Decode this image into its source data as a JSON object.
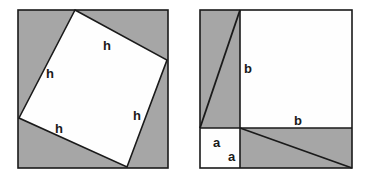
{
  "figure": {
    "width": 370,
    "height": 179,
    "background_color": "#ffffff",
    "shaded_color": "#a6a6a6",
    "unshaded_color": "#fefefe",
    "stroke_color": "#1a1a1a"
  },
  "watermark": {
    "left_text": "RAS'",
    "right_text": "PYTH",
    "sub_text": "M",
    "color": "#d9c6c6"
  },
  "left_panel": {
    "name": "tilted-square-panel",
    "outer_square": {
      "x": 18,
      "y": 10,
      "size": 150
    },
    "inner_square_points": "75,10 167,60 127,167 19,118",
    "labels": [
      {
        "id": "h-top",
        "text": "h",
        "x": 103,
        "y": 50
      },
      {
        "id": "h-left",
        "text": "h",
        "x": 46,
        "y": 78
      },
      {
        "id": "h-right",
        "text": "h",
        "x": 133,
        "y": 120
      },
      {
        "id": "h-bottom",
        "text": "h",
        "x": 55,
        "y": 133
      }
    ]
  },
  "right_panel": {
    "name": "ab-squares-panel",
    "outer_square": {
      "x": 200,
      "y": 10,
      "size": 152
    },
    "divider_x": 240,
    "divider_y": 128,
    "upper_left_triangle_points": "200,10 240,10 200,128",
    "upper_left_shaded_points": "200,10 240,10 240,128 200,128",
    "lower_right_shaded_points": "240,128 352,128 352,168 240,168",
    "diagonal_upper": {
      "x1": 240,
      "y1": 10,
      "x2": 200,
      "y2": 128
    },
    "diagonal_lower": {
      "x1": 240,
      "y1": 128,
      "x2": 352,
      "y2": 168
    },
    "labels": [
      {
        "id": "b-vertical",
        "text": "b",
        "x": 244,
        "y": 73
      },
      {
        "id": "b-horizontal",
        "text": "b",
        "x": 294,
        "y": 125
      },
      {
        "id": "a-upper",
        "text": "a",
        "x": 213,
        "y": 147
      },
      {
        "id": "a-lower",
        "text": "a",
        "x": 228,
        "y": 161
      }
    ]
  }
}
